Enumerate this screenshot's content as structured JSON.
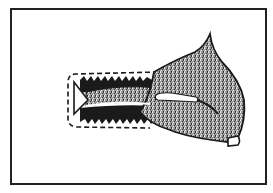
{
  "figure": {
    "type": "line-art illustration",
    "colors": {
      "background": "#ffffff",
      "ink": "#1a1a1a",
      "fabric_fill": "#8a8a8a",
      "frame": "#222222"
    },
    "frame": {
      "x": 10,
      "y": 8,
      "width": 257,
      "height": 177
    },
    "parts": [
      {
        "name": "outer-frame",
        "description": "rectangular border"
      },
      {
        "name": "dashed-stitch-outline",
        "description": "rounded rectangle dashed stitching line at left"
      },
      {
        "name": "serrated-band-top",
        "description": "dark zig-zag edge band (top)"
      },
      {
        "name": "serrated-band-bottom",
        "description": "dark zig-zag edge band (bottom)"
      },
      {
        "name": "fabric-fold",
        "description": "speckled folded fabric with pointed top"
      },
      {
        "name": "fabric-tab",
        "description": "small tab at bottom right corner"
      },
      {
        "name": "slit-opening",
        "description": "white slit/opening in fabric"
      },
      {
        "name": "triangle-notch",
        "description": "triangular notch at left end"
      }
    ]
  }
}
